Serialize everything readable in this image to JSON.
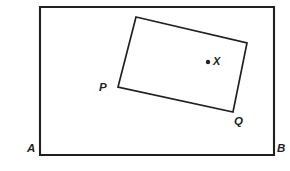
{
  "figure": {
    "background_color": "#ffffff",
    "stroke_color": "#231f20",
    "width": 290,
    "height": 171,
    "outer_rectangle": {
      "name": "outer-rectangle",
      "corners": [
        {
          "label": "",
          "x": 40,
          "y": 7
        },
        {
          "label": "",
          "x": 274,
          "y": 7
        },
        {
          "label": "B",
          "x": 274,
          "y": 155
        },
        {
          "label": "A",
          "x": 40,
          "y": 155
        }
      ],
      "path": "M 40 7 L 274 7 L 274 155 L 40 155 Z",
      "stroke_width": 2.1
    },
    "inner_rectangle": {
      "name": "inner-tilted-rectangle",
      "corners": [
        {
          "label": "",
          "x": 136,
          "y": 17
        },
        {
          "label": "",
          "x": 247,
          "y": 43
        },
        {
          "label": "Q",
          "x": 233,
          "y": 112
        },
        {
          "label": "P",
          "x": 118,
          "y": 87
        }
      ],
      "path": "M 136 17 L 247 43 L 233 112 L 118 87 Z",
      "stroke_width": 1.7
    },
    "point": {
      "name": "point-X",
      "label": "X",
      "x": 208,
      "y": 62,
      "radius": 2.2
    },
    "labels": {
      "A": "A",
      "B": "B",
      "P": "P",
      "Q": "Q",
      "X": "X"
    }
  }
}
